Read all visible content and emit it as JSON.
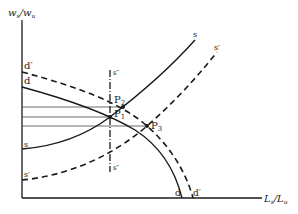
{
  "diagram": {
    "type": "supply-demand-economics",
    "axes": {
      "y_label_main": "w",
      "y_label_sub1": "s",
      "y_label_slash": "/",
      "y_label_main2": "w",
      "y_label_sub2": "u",
      "x_label_main": "L",
      "x_label_sub1": "s",
      "x_label_slash": "/",
      "x_label_main2": "L",
      "x_label_sub2": "u"
    },
    "curves": {
      "d_label_top": "d",
      "d_label_bottom": "d",
      "d_prime_label_top": "d′",
      "d_prime_label_bottom": "d′",
      "s_label_top": "s",
      "s_label_left": "s",
      "s_prime_label_top": "s′",
      "s_prime_label_left": "s′",
      "s_double_prime_top": "s″",
      "s_double_prime_bottom": "s″"
    },
    "points": {
      "p1": "P",
      "p1_sub": "1",
      "p2": "P",
      "p2_sub": "2",
      "p3": "P",
      "p3_sub": "3"
    },
    "colors": {
      "ink": "#1a1a1a",
      "background": "#ffffff"
    }
  }
}
